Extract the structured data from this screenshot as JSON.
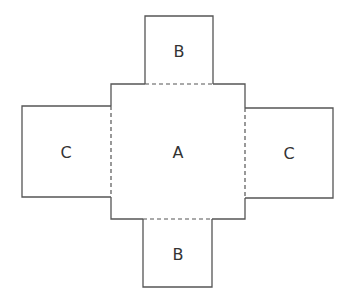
{
  "diagram": {
    "type": "box net / cross unfolding",
    "line_color": "#555555",
    "faces": {
      "center": {
        "label": "A"
      },
      "top": {
        "label": "B"
      },
      "bottom": {
        "label": "B"
      },
      "left": {
        "label": "C"
      },
      "right": {
        "label": "C"
      }
    },
    "fold_lines": "dashed"
  }
}
